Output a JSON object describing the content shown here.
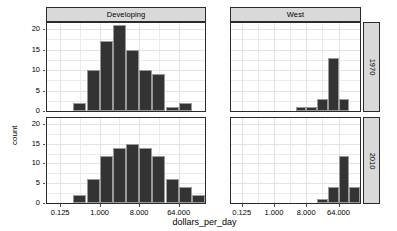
{
  "chart_data": {
    "type": "bar",
    "title": "",
    "subtitle": "",
    "xlabel": "dollars_per_day",
    "ylabel": "count",
    "xscale": "log2",
    "xlim": [
      0.0625,
      256
    ],
    "ylim": [
      0,
      21.5
    ],
    "yticks": [
      0,
      5,
      10,
      15,
      20
    ],
    "ytick_labels": [
      "0",
      "5",
      "10",
      "15",
      "20"
    ],
    "xticks": [
      0.125,
      1,
      8,
      64
    ],
    "xtick_labels": [
      "0.125",
      "1.000",
      "8.000",
      "64.000"
    ],
    "grid": true,
    "legend": "none",
    "facet_cols": [
      "Developing",
      "West"
    ],
    "facet_rows": [
      "1970",
      "2010"
    ],
    "panels": [
      {
        "col": "Developing",
        "row": "1970",
        "bin_starts": [
          0.25,
          0.5,
          1,
          2,
          4,
          8,
          16,
          32,
          64
        ],
        "bin_ends": [
          0.5,
          1,
          2,
          4,
          8,
          16,
          32,
          64,
          128
        ],
        "values": [
          2,
          10,
          17,
          21,
          15,
          10,
          9,
          1,
          2
        ]
      },
      {
        "col": "West",
        "row": "1970",
        "bin_starts": [
          4,
          8,
          16,
          32,
          64
        ],
        "bin_ends": [
          8,
          16,
          32,
          64,
          128
        ],
        "values": [
          1,
          1,
          3,
          13,
          3
        ]
      },
      {
        "col": "Developing",
        "row": "2010",
        "bin_starts": [
          0.25,
          0.5,
          1,
          2,
          4,
          8,
          16,
          32,
          64,
          128
        ],
        "bin_ends": [
          0.5,
          1,
          2,
          4,
          8,
          16,
          32,
          64,
          128,
          256
        ],
        "values": [
          2,
          6,
          12,
          14,
          15,
          14,
          12,
          6,
          4,
          2
        ]
      },
      {
        "col": "West",
        "row": "2010",
        "bin_starts": [
          16,
          32,
          64,
          128
        ],
        "bin_ends": [
          32,
          64,
          128,
          256
        ],
        "values": [
          1,
          4,
          12,
          4
        ]
      }
    ]
  },
  "style": {
    "bar_fill": "#333333",
    "bar_outline": "#9a9a9a",
    "strip_fill": "#d9d9d9",
    "panel_bg": "#ffffff",
    "grid_color": "#ebebeb",
    "border_color": "#2b2b2b"
  }
}
